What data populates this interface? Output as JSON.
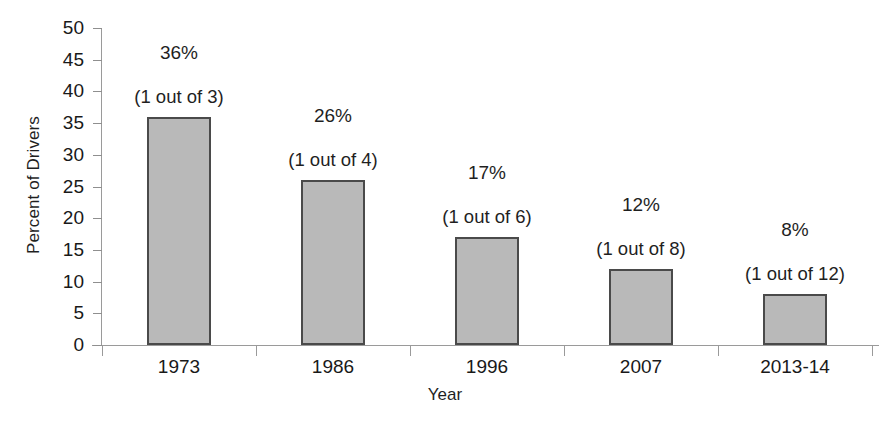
{
  "chart_data": {
    "type": "bar",
    "title": "",
    "xlabel": "Year",
    "ylabel": "Percent of Drivers",
    "categories": [
      "1973",
      "1986",
      "1996",
      "2007",
      "2013-14"
    ],
    "values": [
      36,
      26,
      17,
      12,
      8
    ],
    "value_labels": [
      "36%",
      "26%",
      "17%",
      "12%",
      "8%"
    ],
    "annotations": [
      "(1 out of 3)",
      "(1 out of 4)",
      "(1 out of 6)",
      "(1 out of 8)",
      "(1 out of 12)"
    ],
    "ylim": [
      0,
      50
    ],
    "ytick_labels": [
      "50",
      "45",
      "40",
      "35",
      "30",
      "25",
      "20",
      "15",
      "10",
      "5",
      "0"
    ],
    "ytick_values": [
      50,
      45,
      40,
      35,
      30,
      25,
      20,
      15,
      10,
      5,
      0
    ],
    "grid": false,
    "legend": false,
    "legend_position": "none",
    "bar_fill_color": "#b9b9b9",
    "bar_border_color": "#4a4a4a",
    "axis_color": "#9a9a9a"
  }
}
